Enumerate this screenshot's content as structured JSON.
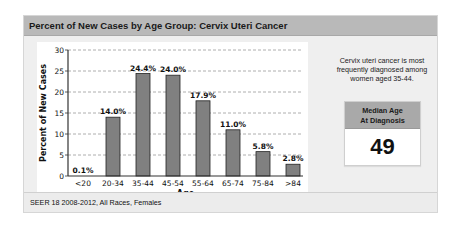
{
  "panel": {
    "title": "Percent of New Cases by Age Group: Cervix Uteri Cancer",
    "footer": "SEER 18 2008-2012, All Races, Females"
  },
  "side": {
    "description": "Cervix uteri cancer is most frequently diagnosed among women aged 35-44.",
    "median_label_line1": "Median Age",
    "median_label_line2": "At Diagnosis",
    "median_value": "49"
  },
  "colors": {
    "bar_fill": "#808080",
    "bar_stroke": "#222222",
    "header_bg": "#b9b9b9",
    "median_header_bg": "#a9a9a9"
  },
  "chart_data": {
    "type": "bar",
    "title": "Percent of New Cases by Age Group: Cervix Uteri Cancer",
    "xlabel": "Age",
    "ylabel": "Percent of New Cases",
    "categories": [
      "<20",
      "20-34",
      "35-44",
      "45-54",
      "55-64",
      "65-74",
      "75-84",
      ">84"
    ],
    "values": [
      0.1,
      14.0,
      24.4,
      24.0,
      17.9,
      11.0,
      5.8,
      2.8
    ],
    "value_labels": [
      "0.1%",
      "14.0%",
      "24.4%",
      "24.0%",
      "17.9%",
      "11.0%",
      "5.8%",
      "2.8%"
    ],
    "ylim": [
      0,
      30
    ],
    "yticks": [
      0,
      5,
      10,
      15,
      20,
      25,
      30
    ],
    "grid": "horizontal dashed",
    "legend": "none"
  }
}
